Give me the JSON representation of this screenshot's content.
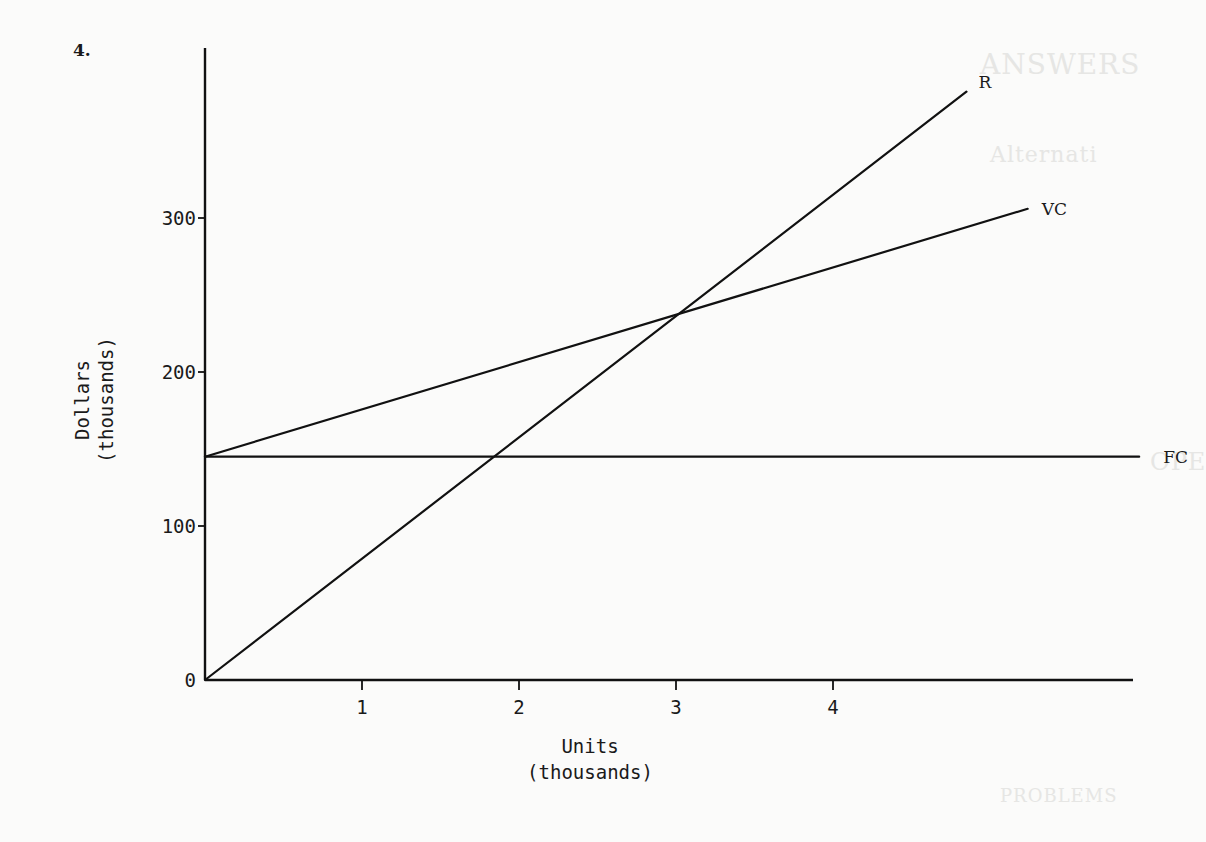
{
  "problem_number": "4.",
  "bleed_through_text": [
    {
      "text": "ANSWERS",
      "x": 980,
      "y": 48,
      "size": 28
    },
    {
      "text": "Alternati",
      "x": 990,
      "y": 142,
      "size": 22
    },
    {
      "text": "OPE",
      "x": 1150,
      "y": 448,
      "size": 24
    },
    {
      "text": "PROBLEMS",
      "x": 1000,
      "y": 785,
      "size": 18
    }
  ],
  "chart_data": {
    "type": "line",
    "title": "",
    "xlabel": "Units\n(thousands)",
    "xlabel_lines": [
      "Units",
      "(thousands)"
    ],
    "ylabel": "Dollars (thousands)",
    "ylabel_lines": [
      "Dollars",
      "(thousands)"
    ],
    "xlim": [
      0,
      5.95
    ],
    "ylim": [
      0,
      410
    ],
    "x_ticks": [
      1,
      2,
      3,
      4
    ],
    "x_tick_labels": [
      "1",
      "2",
      "3",
      "4"
    ],
    "y_ticks": [
      0,
      100,
      200,
      300
    ],
    "y_tick_labels": [
      "0",
      "100",
      "200",
      "300"
    ],
    "grid": false,
    "legend": "inline labels at line ends",
    "series": [
      {
        "name": "R",
        "label": "R",
        "description": "Revenue",
        "x": [
          0,
          4.85
        ],
        "y": [
          0,
          382
        ]
      },
      {
        "name": "VC",
        "label": "VC",
        "description": "Variable cost (total cost)",
        "x": [
          0,
          5.24
        ],
        "y": [
          145,
          306
        ]
      },
      {
        "name": "FC",
        "label": "FC",
        "description": "Fixed cost",
        "x": [
          0,
          5.95
        ],
        "y": [
          145,
          145
        ]
      }
    ],
    "annotations": [
      {
        "type": "intersection",
        "series": [
          "R",
          "VC"
        ],
        "x": 3.0,
        "y": 238
      },
      {
        "type": "intersection",
        "series": [
          "R",
          "FC"
        ],
        "x": 1.84,
        "y": 145
      }
    ]
  },
  "layout": {
    "origin_px": [
      205,
      680
    ],
    "px_per_x_unit": 157,
    "px_per_y_unit": 1.54,
    "y_axis_top_px": 48,
    "x_axis_right_px": 1133,
    "line_color": "#111111"
  }
}
